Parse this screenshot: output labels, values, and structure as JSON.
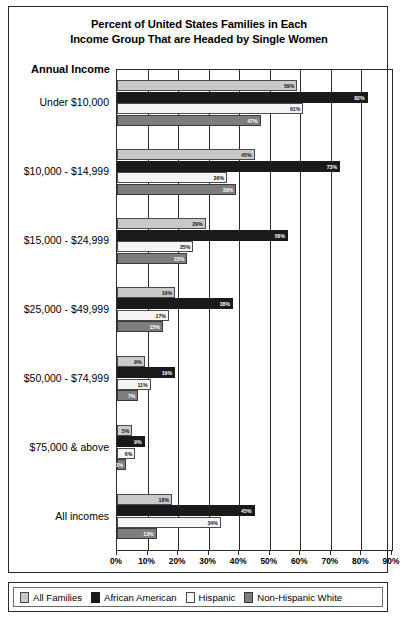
{
  "chart_data": {
    "type": "bar",
    "orientation": "horizontal",
    "title": "Percent of United States Families in Each Income Group That are Headed by Single Women",
    "title_lines": [
      "Percent of United States Families in Each",
      "Income Group That are Headed by Single Women"
    ],
    "axis_header": "Annual Income",
    "xlabel": "",
    "ylabel": "Annual Income",
    "xlim": [
      0,
      90
    ],
    "grid": true,
    "legend_position": "bottom",
    "categories": [
      "Under $10,000",
      "$10,000 - $14,999",
      "$15,000 - $24,999",
      "$25,000 - $49,999",
      "$50,000 - $74,999",
      "$75,000 & above",
      "All incomes"
    ],
    "series": [
      {
        "name": "All Families",
        "color": "#c9c9c9",
        "values": [
          59,
          45,
          29,
          19,
          9,
          5,
          18
        ]
      },
      {
        "name": "African American",
        "color": "#1a1a1a",
        "values": [
          82,
          73,
          56,
          38,
          19,
          9,
          45
        ]
      },
      {
        "name": "Hispanic",
        "color": "#f5f5f5",
        "values": [
          61,
          36,
          25,
          17,
          11,
          6,
          34
        ]
      },
      {
        "name": "Non-Hispanic White",
        "color": "#7d7d7d",
        "values": [
          47,
          39,
          23,
          15,
          7,
          3,
          13
        ]
      }
    ],
    "value_labels": [
      [
        "59%",
        "82%",
        "61%",
        "47%"
      ],
      [
        "45%",
        "73%",
        "36%",
        "39%"
      ],
      [
        "29%",
        "56%",
        "25%",
        "23%"
      ],
      [
        "19%",
        "38%",
        "17%",
        "15%"
      ],
      [
        "9%",
        "19%",
        "11%",
        "7%"
      ],
      [
        "5%",
        "9%",
        "6%",
        "3%"
      ],
      [
        "18%",
        "45%",
        "34%",
        "13%"
      ]
    ],
    "xticks": [
      0,
      10,
      20,
      30,
      40,
      50,
      60,
      70,
      80,
      90
    ],
    "xtick_labels": [
      "0%",
      "10%",
      "20%",
      "30%",
      "40%",
      "50%",
      "60%",
      "70%",
      "80%",
      "90%"
    ]
  },
  "legend": {
    "items": [
      {
        "label": "All Families"
      },
      {
        "label": "African American"
      },
      {
        "label": "Hispanic"
      },
      {
        "label": "Non-Hispanic White"
      }
    ]
  }
}
